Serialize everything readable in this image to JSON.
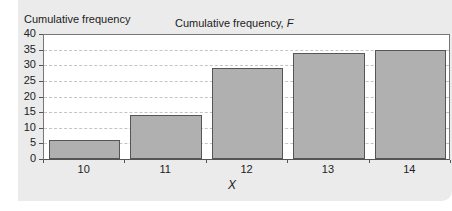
{
  "chart_data": {
    "type": "bar",
    "title": "Cumulative frequency, F",
    "title_plain": "Cumulative frequency, ",
    "title_var": "F",
    "xlabel": "X",
    "ylabel": "Cumulative frequency",
    "categories": [
      "10",
      "11",
      "12",
      "13",
      "14"
    ],
    "values": [
      6,
      14,
      29,
      34,
      35
    ],
    "ylim": [
      0,
      40
    ],
    "yticks": [
      0,
      5,
      10,
      15,
      20,
      25,
      30,
      35,
      40
    ],
    "grid": true,
    "legend": null,
    "colors": {
      "bar": "#b0b0b0",
      "bar_border": "#555555",
      "panel": "#ebebeb",
      "grid": "#c4c4c4"
    }
  }
}
